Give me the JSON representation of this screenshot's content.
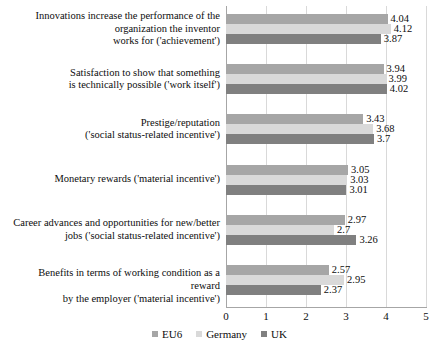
{
  "chart_data": {
    "type": "bar",
    "orientation": "horizontal",
    "title": "",
    "xlabel": "",
    "ylabel": "",
    "xlim": [
      0,
      5
    ],
    "xticks": [
      "0",
      "1",
      "2",
      "3",
      "4",
      "5"
    ],
    "grid": true,
    "legend_position": "bottom",
    "categories": [
      "Innovations increase the performance of the organization the inventor works for ('achievement')",
      "Satisfaction to show that something is technically possible ('work itself')",
      "Prestige/reputation ('social status-related incentive')",
      "Monetary rewards ('material incentive')",
      "Career advances and opportunities for new/better jobs ('social status-related incentive')",
      "Benefits in terms of working condition as a reward by the employer ('material incentive')"
    ],
    "category_lines": [
      [
        "Innovations increase the performance of the",
        "organization the inventor",
        "works for ('achievement')"
      ],
      [
        "Satisfaction to show that something",
        "is technically possible ('work itself')"
      ],
      [
        "Prestige/reputation",
        "('social status-related incentive')"
      ],
      [
        "Monetary rewards ('material incentive')"
      ],
      [
        "Career advances and opportunities for new/better",
        "jobs ('social status-related incentive')"
      ],
      [
        "Benefits in terms of working condition as a reward",
        "by the employer ('material incentive')"
      ]
    ],
    "series": [
      {
        "name": "EU6",
        "color": "#a6a6a6",
        "values": [
          4.04,
          3.94,
          3.43,
          3.05,
          2.97,
          2.57
        ],
        "labels": [
          "4.04",
          "3.94",
          "3.43",
          "3.05",
          "2.97",
          "2.57"
        ]
      },
      {
        "name": "Germany",
        "color": "#d9d9d9",
        "values": [
          4.12,
          3.99,
          3.68,
          3.03,
          2.7,
          2.95
        ],
        "labels": [
          "4.12",
          "3.99",
          "3.68",
          "3.03",
          "2.7",
          "2.95"
        ]
      },
      {
        "name": "UK",
        "color": "#808080",
        "values": [
          3.87,
          4.02,
          3.7,
          3.01,
          3.26,
          2.37
        ],
        "labels": [
          "3.87",
          "4.02",
          "3.7",
          "3.01",
          "3.26",
          "2.37"
        ]
      }
    ]
  }
}
